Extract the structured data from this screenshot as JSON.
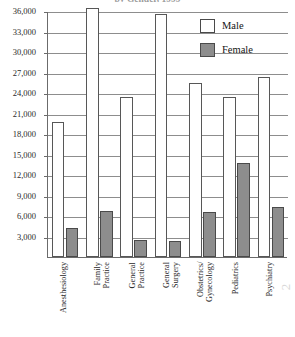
{
  "chart_data": {
    "type": "bar",
    "title": "by Gender, 1999",
    "xlabel": "",
    "ylabel": "",
    "ylim": [
      0,
      36000
    ],
    "ytick_step": 3000,
    "ytick_labels": [
      "36,000",
      "33,000",
      "30,000",
      "27,000",
      "24,000",
      "21,000",
      "18,000",
      "15,000",
      "12,000",
      "9,000",
      "6,000",
      "3,000"
    ],
    "ytick_values": [
      36000,
      33000,
      30000,
      27000,
      24000,
      21000,
      18000,
      15000,
      12000,
      9000,
      6000,
      3000
    ],
    "grid": true,
    "legend_position": "top-right",
    "categories": [
      "Anesthesiology",
      "Family Practice",
      "General Practice",
      "General Surgery",
      "Obstetrics/ Gynecology",
      "Pediatrics",
      "Psychiatry"
    ],
    "category_lines": [
      [
        "Anesthesiology"
      ],
      [
        "Family",
        "Practice"
      ],
      [
        "General",
        "Practice"
      ],
      [
        "General",
        "Surgery"
      ],
      [
        "Obstetrics/",
        "Gynecology"
      ],
      [
        "Pediatrics"
      ],
      [
        "Psychiatry"
      ]
    ],
    "series": [
      {
        "name": "Male",
        "color": "#ffffff",
        "values": [
          19800,
          36400,
          23400,
          35500,
          25400,
          23400,
          26400
        ]
      },
      {
        "name": "Female",
        "color": "#8d8d8d",
        "values": [
          4200,
          6800,
          2500,
          2400,
          6600,
          13800,
          7300
        ]
      }
    ]
  },
  "legend": {
    "items": [
      {
        "label": "Male"
      },
      {
        "label": "Female"
      }
    ]
  },
  "artifact": {
    "mark": "2"
  }
}
